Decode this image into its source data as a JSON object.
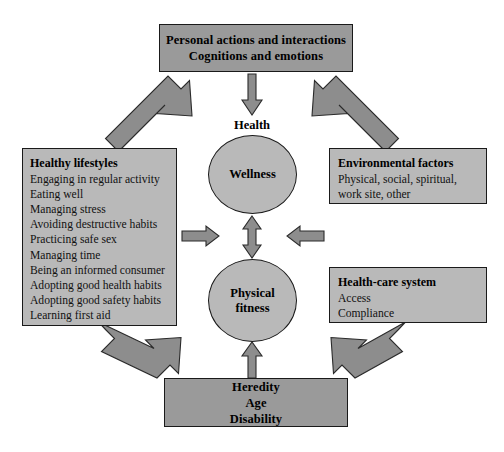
{
  "diagram": {
    "caption": "",
    "colors": {
      "box_dark_fill": "#9a9a9a",
      "box_light_fill": "#b9b9b9",
      "circle_fill": "#b9b9b9",
      "arrow_fill": "#8d8d8d",
      "outline": "#1a1a1a",
      "background": "#ffffff"
    }
  },
  "nodes": {
    "personal": {
      "name": "Personal actions and interactions / Cognitions and emotions",
      "lines": [
        "Personal actions and interactions",
        "Cognitions and emotions"
      ]
    },
    "heredity": {
      "name": "Heredity / Age / Disability",
      "lines": [
        "Heredity",
        "Age",
        "Disability"
      ]
    },
    "lifestyles": {
      "heading": "Healthy lifestyles",
      "items": [
        "Engaging in regular activity",
        "Eating well",
        "Managing stress",
        "Avoiding destructive habits",
        "Practicing safe sex",
        "Managing time",
        "Being an informed consumer",
        "Adopting good health habits",
        "Adopting good safety habits",
        "Learning first aid"
      ]
    },
    "environment": {
      "heading": "Environmental factors",
      "items": [
        "Physical, social, spiritual,",
        "work site, other"
      ]
    },
    "healthcare": {
      "heading": "Health-care system",
      "items": [
        "Access",
        "Compliance"
      ]
    },
    "health_label": "Health",
    "wellness": {
      "lines": [
        "Wellness"
      ]
    },
    "fitness": {
      "lines": [
        "Physical",
        "fitness"
      ]
    }
  },
  "connectors": [
    {
      "id": "personal-to-lifestyles",
      "style": "double-headed",
      "orientation": "diagonal"
    },
    {
      "id": "personal-to-environment",
      "style": "double-headed",
      "orientation": "diagonal"
    },
    {
      "id": "lifestyles-to-heredity",
      "style": "double-headed",
      "orientation": "diagonal"
    },
    {
      "id": "healthcare-to-heredity",
      "style": "double-headed",
      "orientation": "diagonal"
    },
    {
      "id": "personal-to-health",
      "style": "single-headed",
      "orientation": "vertical-down"
    },
    {
      "id": "heredity-to-fitness",
      "style": "single-headed",
      "orientation": "vertical-up"
    },
    {
      "id": "wellness-to-fitness",
      "style": "double-headed",
      "orientation": "vertical"
    },
    {
      "id": "lifestyles-to-center",
      "style": "single-headed",
      "orientation": "horizontal-right"
    },
    {
      "id": "environment-to-center",
      "style": "single-headed",
      "orientation": "horizontal-left"
    }
  ]
}
